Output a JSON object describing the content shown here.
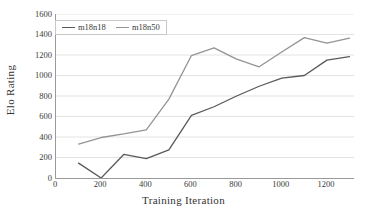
{
  "chart_data": {
    "type": "line",
    "title": "",
    "xlabel": "Training Iteration",
    "ylabel": "Elo Rating",
    "xlim": [
      0,
      1320
    ],
    "ylim": [
      0,
      1600
    ],
    "x_ticks": [
      0,
      200,
      400,
      600,
      800,
      1000,
      1200
    ],
    "y_ticks": [
      0,
      200,
      400,
      600,
      800,
      1000,
      1200,
      1400,
      1600
    ],
    "grid": "horizontal",
    "legend_position": "top-left-inside",
    "x": [
      100,
      200,
      300,
      400,
      500,
      600,
      700,
      800,
      900,
      1000,
      1100,
      1200,
      1300
    ],
    "series": [
      {
        "name": "m18n18",
        "color": "#595959",
        "values": [
          145,
          0,
          230,
          190,
          275,
          610,
          695,
          800,
          895,
          975,
          1000,
          1150,
          1185
        ]
      },
      {
        "name": "m18n50",
        "color": "#949494",
        "values": [
          330,
          395,
          430,
          470,
          770,
          1195,
          1270,
          1160,
          1085,
          1230,
          1370,
          1315,
          1365
        ]
      }
    ]
  },
  "legend": {
    "entries": [
      {
        "label": "m18n18"
      },
      {
        "label": "m18n50"
      }
    ]
  },
  "axes": {
    "x_title": "Training Iteration",
    "y_title": "Elo Rating",
    "x_tick_labels": [
      "0",
      "200",
      "400",
      "600",
      "800",
      "1000",
      "1200"
    ],
    "y_tick_labels": [
      "0",
      "200",
      "400",
      "600",
      "800",
      "1000",
      "1200",
      "1400",
      "1600"
    ]
  },
  "colors": {
    "series_1": "#595959",
    "series_2": "#949494",
    "axis": "#9a9a9a",
    "grid": "#dcdcdc",
    "text": "#3a3a3a",
    "background": "#ffffff"
  }
}
